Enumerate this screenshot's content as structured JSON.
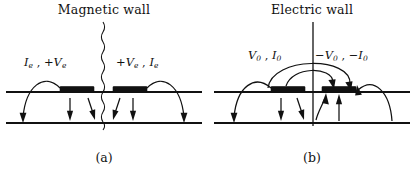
{
  "figure": {
    "caption_a": "(a)",
    "caption_b": "(b)"
  },
  "panel_a": {
    "title": "Magnetic wall",
    "wall_type": "magnetic",
    "wall_style": "wavy-dashed",
    "label_left": {
      "current": "I",
      "current_sub": "e",
      "sep": " , ",
      "voltage_sign": "+",
      "voltage": "V",
      "voltage_sub": "e"
    },
    "label_right": {
      "voltage_sign": "+",
      "voltage": "V",
      "voltage_sub": "e",
      "sep": " , ",
      "current": "I",
      "current_sub": "e"
    },
    "patches": 2,
    "field_direction": "downward",
    "arrow_count_left": 3,
    "arrow_count_right": 3
  },
  "panel_b": {
    "title": "Electric wall",
    "wall_type": "electric",
    "wall_style": "solid",
    "label_left": {
      "voltage": "V",
      "voltage_sub": "0",
      "sep": " , ",
      "current": "I",
      "current_sub": "0"
    },
    "label_right": {
      "voltage_sign": "−",
      "voltage": "V",
      "voltage_sub": "0",
      "sep": " , ",
      "current_sign": "−",
      "current": "I",
      "current_sub": "0"
    },
    "patches": 2,
    "field_direction_left": "downward",
    "field_direction_right": "upward",
    "arcs_over_wall": 2,
    "arrow_count_left": 3,
    "arrow_count_right": 3
  },
  "colors": {
    "ink": "#111111",
    "background": "#ffffff"
  },
  "icons": {
    "wavy_wall": "wavy-vertical-line-icon",
    "solid_wall": "solid-vertical-line-icon",
    "patch": "metal-patch-icon",
    "field_arrow": "field-arrow-icon"
  }
}
